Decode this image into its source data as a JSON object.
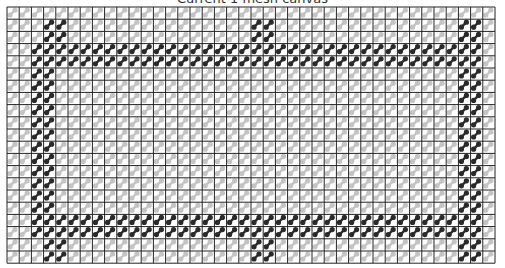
{
  "title": "Current 1 mesh canvas",
  "grid": {
    "origin_x": 7,
    "origin_y": 7,
    "cell": 12.2,
    "cols": 40,
    "rows": 21,
    "line_color": "#222222",
    "light_color": "#c4c4c4",
    "dark_color": "#2a2a2a"
  },
  "dark_rows": [
    3,
    4,
    17,
    18
  ],
  "dark_cols": [
    2,
    3,
    37,
    38
  ],
  "dark_frame": {
    "row_from": 3,
    "row_to": 18,
    "col_from": 2,
    "col_to": 38
  },
  "dark_extra": [
    [
      1,
      3
    ],
    [
      1,
      4
    ],
    [
      2,
      3
    ],
    [
      2,
      4
    ],
    [
      1,
      20
    ],
    [
      1,
      21
    ],
    [
      2,
      20
    ],
    [
      2,
      21
    ],
    [
      1,
      37
    ],
    [
      1,
      38
    ],
    [
      2,
      37
    ],
    [
      2,
      38
    ],
    [
      19,
      3
    ],
    [
      19,
      4
    ],
    [
      20,
      3
    ],
    [
      20,
      4
    ],
    [
      19,
      20
    ],
    [
      19,
      21
    ],
    [
      20,
      20
    ],
    [
      20,
      21
    ],
    [
      19,
      37
    ],
    [
      19,
      38
    ],
    [
      20,
      37
    ],
    [
      20,
      38
    ]
  ]
}
